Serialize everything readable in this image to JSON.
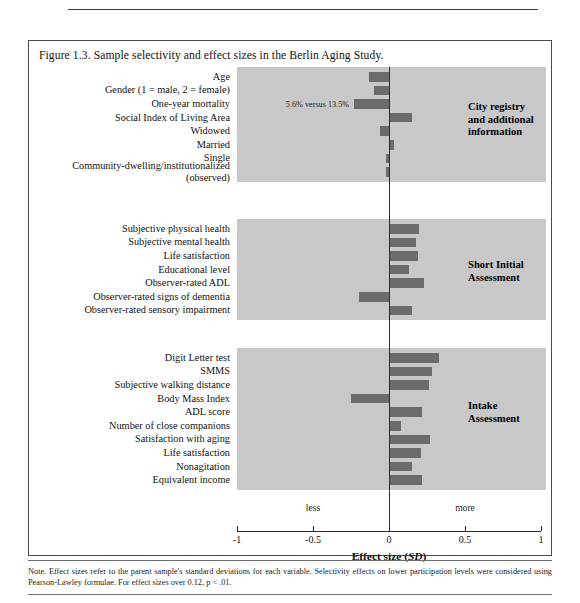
{
  "figure": {
    "caption": "Figure 1.3. Sample selectivity and effect sizes in the Berlin Aging Study.",
    "note_line1": "Note. Effect sizes refer to the parent sample's standard deviations for each variable. Selectivity effects on lower participation levels were",
    "note_line2": "considered using Pearson-Lawley formulae. For effect sizes over 0.12, p < .01."
  },
  "axis": {
    "title": "Effect size (SD)",
    "title_main": "Effect size (",
    "title_italic": "SD",
    "title_tail": ")",
    "ticks": [
      "-1",
      "-0.5",
      "0",
      "0.5",
      "1"
    ],
    "tick_values": [
      -1,
      -0.5,
      0,
      0.5,
      1
    ],
    "less_label": "less",
    "more_label": "more",
    "xmin": -1,
    "xmax": 1
  },
  "panels": [
    {
      "title_lines": [
        "City registry",
        "and additional",
        "information"
      ],
      "rows": [
        {
          "label": "Age",
          "value": -0.13
        },
        {
          "label": "Gender (1 = male, 2 = female)",
          "value": -0.1
        },
        {
          "label": "One-year mortality",
          "value": -0.23,
          "note": "5.6% versus 13.5%"
        },
        {
          "label": "Social Index of Living Area",
          "value": 0.15
        },
        {
          "label": "Widowed",
          "value": -0.06
        },
        {
          "label": "Married",
          "value": 0.03
        },
        {
          "label": "Single",
          "value": -0.02
        },
        {
          "label": "Community-dwelling/institutionalized",
          "label2": "(observed)",
          "value": -0.02
        }
      ]
    },
    {
      "title_lines": [
        "Short Initial",
        "Assessment"
      ],
      "rows": [
        {
          "label": "Subjective physical health",
          "value": 0.2
        },
        {
          "label": "Subjective mental health",
          "value": 0.18
        },
        {
          "label": "Life satisfaction",
          "value": 0.19
        },
        {
          "label": "Educational level",
          "value": 0.13
        },
        {
          "label": "Observer-rated ADL",
          "value": 0.23
        },
        {
          "label": "Observer-rated signs of dementia",
          "value": -0.2
        },
        {
          "label": "Observer-rated sensory impairment",
          "value": 0.15
        }
      ]
    },
    {
      "title_lines": [
        "Intake",
        "Assessment"
      ],
      "rows": [
        {
          "label": "Digit Letter test",
          "value": 0.33
        },
        {
          "label": "SMMS",
          "value": 0.28
        },
        {
          "label": "Subjective walking distance",
          "value": 0.26
        },
        {
          "label": "Body Mass Index",
          "value": -0.25
        },
        {
          "label": "ADL score",
          "value": 0.22
        },
        {
          "label": "Number of close companions",
          "value": 0.08
        },
        {
          "label": "Satisfaction with aging",
          "value": 0.27
        },
        {
          "label": "Life satisfaction",
          "value": 0.21
        },
        {
          "label": "Nonagitation",
          "value": 0.15
        },
        {
          "label": "Equivalent income",
          "value": 0.22
        }
      ]
    }
  ],
  "chart_data": {
    "type": "bar",
    "title": "Figure 1.3. Sample selectivity and effect sizes in the Berlin Aging Study.",
    "xlabel": "Effect size (SD)",
    "ylabel": "",
    "xlim": [
      -1,
      1
    ],
    "xticks": [
      -1,
      -0.5,
      0,
      0.5,
      1
    ],
    "orientation": "horizontal",
    "grid": false,
    "legend": "none",
    "groups": [
      {
        "name": "City registry and additional information",
        "categories": [
          "Age",
          "Gender (1 = male, 2 = female)",
          "One-year mortality",
          "Social Index of Living Area",
          "Widowed",
          "Married",
          "Single",
          "Community-dwelling/institutionalized (observed)"
        ],
        "values": [
          -0.13,
          -0.1,
          -0.23,
          0.15,
          -0.06,
          0.03,
          -0.02,
          -0.02
        ],
        "annotations": {
          "One-year mortality": "5.6% versus 13.5%"
        }
      },
      {
        "name": "Short Initial Assessment",
        "categories": [
          "Subjective physical health",
          "Subjective mental health",
          "Life satisfaction",
          "Educational level",
          "Observer-rated ADL",
          "Observer-rated signs of dementia",
          "Observer-rated sensory impairment"
        ],
        "values": [
          0.2,
          0.18,
          0.19,
          0.13,
          0.23,
          -0.2,
          0.15
        ]
      },
      {
        "name": "Intake Assessment",
        "categories": [
          "Digit Letter test",
          "SMMS",
          "Subjective walking distance",
          "Body Mass Index",
          "ADL score",
          "Number of close companions",
          "Satisfaction with aging",
          "Life satisfaction",
          "Nonagitation",
          "Equivalent income"
        ],
        "values": [
          0.33,
          0.28,
          0.26,
          -0.25,
          0.22,
          0.08,
          0.27,
          0.21,
          0.15,
          0.22
        ]
      }
    ],
    "bar_color": "#6b6b6b",
    "panel_color": "#c8c8c8",
    "note": "Note. Effect sizes refer to the parent sample's standard deviations for each variable. Selectivity effects on lower participation levels were considered using Pearson-Lawley formulae. For effect sizes over 0.12, p < .01."
  }
}
